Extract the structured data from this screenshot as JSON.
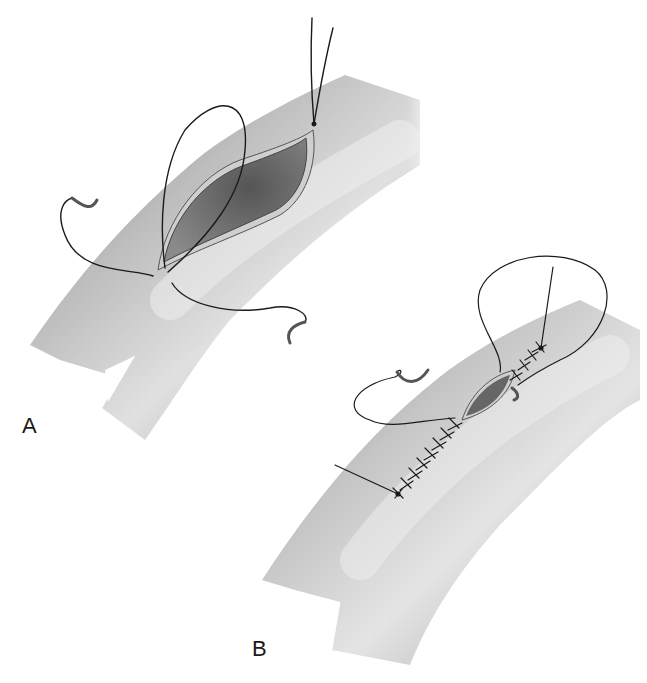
{
  "figure": {
    "panels": [
      {
        "label": "A",
        "description": "Opened vessel (arteriotomy) with suture needles placed at both ends"
      },
      {
        "label": "B",
        "description": "Vessel incision being closed with running suture from both ends"
      }
    ]
  },
  "colors": {
    "background": "#ffffff",
    "vessel_light": "#e6e6e6",
    "vessel_mid": "#bdbdbd",
    "vessel_dark": "#8a8a8a",
    "lumen": "#6a6a6a",
    "suture": "#1a1a1a"
  }
}
